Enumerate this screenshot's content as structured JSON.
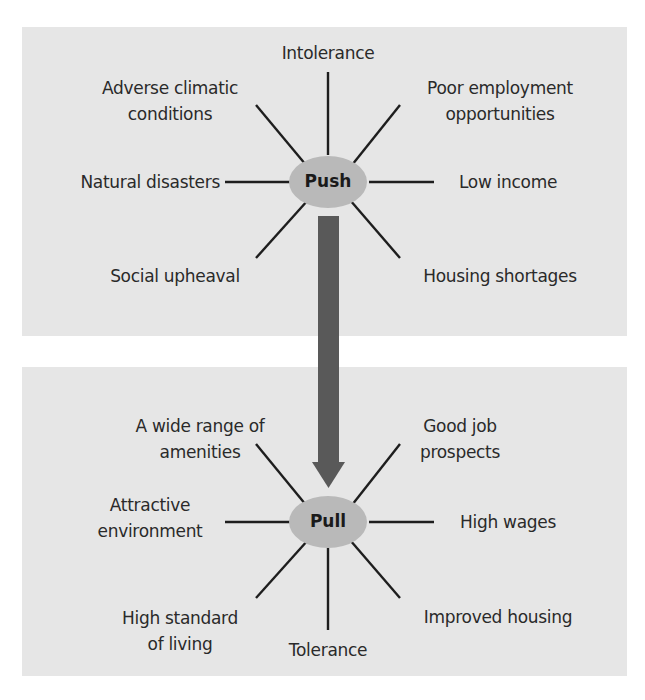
{
  "diagram": {
    "colors": {
      "panel_bg": "#e6e6e6",
      "hub_fill": "#b9b9b9",
      "arrow": "#595959",
      "lines": "#1e1e1e",
      "text": "#2a2a2a"
    },
    "push": {
      "hub_label": "Push",
      "factors": {
        "top": "Intolerance",
        "top_left": [
          "Adverse climatic",
          "conditions"
        ],
        "top_right": [
          "Poor employment",
          "opportunities"
        ],
        "left": "Natural disasters",
        "right": "Low income",
        "bottom_left": "Social upheaval",
        "bottom_right": "Housing shortages"
      }
    },
    "pull": {
      "hub_label": "Pull",
      "factors": {
        "top_left": [
          "A wide range of",
          "amenities"
        ],
        "top_right": [
          "Good job",
          "prospects"
        ],
        "left": [
          "Attractive",
          "environment"
        ],
        "right": "High wages",
        "bottom_left": [
          "High standard",
          "of living"
        ],
        "bottom": "Tolerance",
        "bottom_right": "Improved housing"
      }
    },
    "connector": {
      "direction": "push-to-pull",
      "shape": "down-arrow"
    }
  }
}
